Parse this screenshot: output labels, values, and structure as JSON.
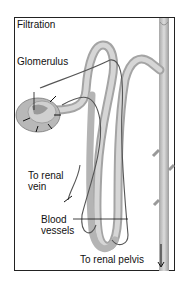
{
  "title": "Filtration",
  "labels": {
    "glomerulus": "Glomerulus",
    "renal_vein_line1": "To renal",
    "renal_vein_line2": "vein",
    "blood_vessels_line1": "Blood",
    "blood_vessels_line2": "vessels",
    "renal_pelvis": "To renal pelvis"
  },
  "colors": {
    "tubule": "#c8c8c8",
    "tubule_shade": "#9a9a9a",
    "vessel": "#555555",
    "frame": "#222222"
  }
}
